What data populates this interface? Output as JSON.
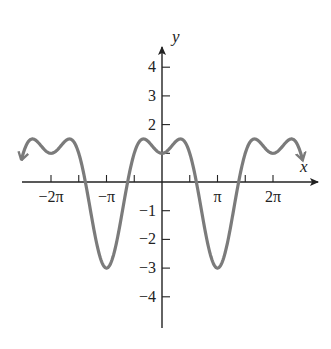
{
  "chart_data": {
    "type": "line",
    "title": "",
    "function": "y = 2cos(x) - cos(2x)",
    "xlabel": "x",
    "ylabel": "y",
    "xlim": [
      -8.0,
      8.0
    ],
    "ylim": [
      -5.0,
      4.6
    ],
    "x_ticks": [
      {
        "value": -6.2832,
        "label": "−2π"
      },
      {
        "value": -4.7124,
        "label": ""
      },
      {
        "value": -3.1416,
        "label": "−π"
      },
      {
        "value": -1.5708,
        "label": ""
      },
      {
        "value": 1.5708,
        "label": ""
      },
      {
        "value": 3.1416,
        "label": "π"
      },
      {
        "value": 4.7124,
        "label": ""
      },
      {
        "value": 6.2832,
        "label": "2π"
      }
    ],
    "y_ticks": [
      {
        "value": 4,
        "label": "4"
      },
      {
        "value": 3,
        "label": "3"
      },
      {
        "value": 2,
        "label": "2"
      },
      {
        "value": 1,
        "label": ""
      },
      {
        "value": -1,
        "label": "−1"
      },
      {
        "value": -2,
        "label": "−2"
      },
      {
        "value": -3,
        "label": "−3"
      },
      {
        "value": -4,
        "label": "−4"
      }
    ],
    "series": [
      {
        "name": "f(x)",
        "x_range": [
          -7.95,
          7.95
        ],
        "key_points": [
          {
            "x": -6.2832,
            "y": 1
          },
          {
            "x": -5.236,
            "y": 1.5
          },
          {
            "x": -3.1416,
            "y": -3
          },
          {
            "x": -1.0472,
            "y": 1.5
          },
          {
            "x": 0,
            "y": 1
          },
          {
            "x": 1.0472,
            "y": 1.5
          },
          {
            "x": 3.1416,
            "y": -3
          },
          {
            "x": 5.236,
            "y": 1.5
          },
          {
            "x": 6.2832,
            "y": 1
          }
        ],
        "color": "#7b7b7b",
        "arrows_at_ends": true
      }
    ],
    "grid": false,
    "legend": null
  },
  "style": {
    "axis_color": "#222222",
    "curve_color": "#7b7b7b"
  }
}
